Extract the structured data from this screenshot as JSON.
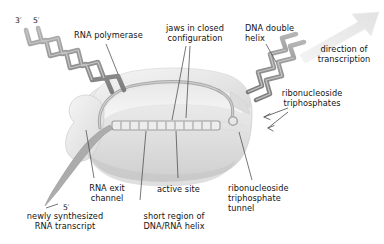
{
  "figure": {
    "background_color": "#ffffff",
    "text_color": "#131313",
    "dna_color": "#9b9b9b",
    "enzyme_color": "#e6e6e6",
    "leader_color": "#5f5f5f"
  },
  "labels": {
    "three_prime": "3′",
    "five_prime_top": "5′",
    "rna_polymerase": "RNA polymerase",
    "jaws_closed": "jaws in closed\nconfiguration",
    "dna_double_helix": "DNA double\nhelix",
    "direction_of_transcription": "direction of\ntranscription",
    "ribonucleoside_triphosphates": "ribonucleoside\ntriphosphates",
    "rna_exit_channel": "RNA exit\nchannel",
    "active_site": "active site",
    "rnt_tunnel": "ribonucleoside\ntriphosphate\ntunnel",
    "newly_synthesized": "newly synthesized\nRNA transcript",
    "short_region": "short region of\nDNA/RNA helix",
    "five_prime_rna": "5′"
  },
  "structures": {
    "enzyme_name": "rna-polymerase-body",
    "dna_strand_name": "dna-double-helix",
    "rna_transcript_name": "rna-transcript",
    "arrow_name": "transcription-direction-arrow",
    "ntp_arrows": 2,
    "helix_rungs": 11
  }
}
